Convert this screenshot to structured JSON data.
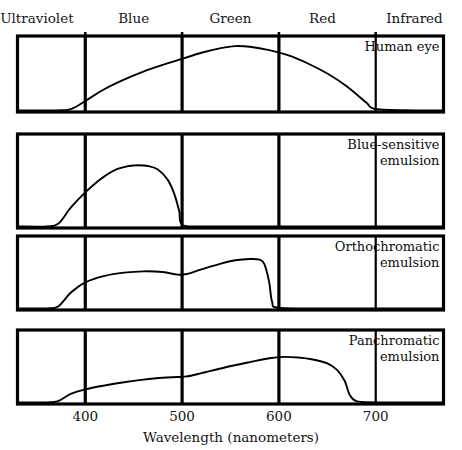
{
  "figure": {
    "title": "",
    "axis_title": "Wavelength (nanometers)",
    "band_headers": [
      {
        "label": "Ultraviolet",
        "center_nm": 350
      },
      {
        "label": "Blue",
        "center_nm": 450
      },
      {
        "label": "Green",
        "center_nm": 550
      },
      {
        "label": "Red",
        "center_nm": 645
      },
      {
        "label": "Infrared",
        "center_nm": 740
      }
    ],
    "tick_labels": [
      "400",
      "500",
      "600",
      "700"
    ],
    "panel_labels": [
      {
        "line1": "Human eye",
        "line2": ""
      },
      {
        "line1": "Blue-sensitive",
        "line2": "emulsion"
      },
      {
        "line1": "Orthochromatic",
        "line2": "emulsion"
      },
      {
        "line1": "Panchromatic",
        "line2": "emulsion"
      }
    ],
    "colors": {
      "ink": "#000000",
      "background": "#ffffff",
      "curve": "#000000",
      "frame": "#000000"
    }
  },
  "chart_data": {
    "type": "line",
    "xlabel": "Wavelength (nanometers)",
    "ylabel": "Relative sensitivity",
    "xlim": [
      330,
      770
    ],
    "ylim": [
      0,
      1
    ],
    "grid": false,
    "legend": "inside-panel-top-right",
    "xticks": [
      400,
      500,
      600,
      700
    ],
    "spectral_bands": [
      {
        "name": "Ultraviolet",
        "range_nm": [
          330,
          400
        ]
      },
      {
        "name": "Blue",
        "range_nm": [
          400,
          500
        ]
      },
      {
        "name": "Green",
        "range_nm": [
          500,
          600
        ]
      },
      {
        "name": "Red",
        "range_nm": [
          600,
          700
        ]
      },
      {
        "name": "Infrared",
        "range_nm": [
          700,
          770
        ]
      }
    ],
    "panels": [
      {
        "name": "Human eye",
        "x": [
          330,
          370,
          385,
          400,
          420,
          440,
          460,
          480,
          500,
          520,
          540,
          555,
          570,
          590,
          610,
          630,
          650,
          670,
          690,
          700,
          740,
          770
        ],
        "y": [
          0,
          0,
          0.02,
          0.14,
          0.32,
          0.46,
          0.58,
          0.68,
          0.77,
          0.86,
          0.93,
          0.96,
          0.95,
          0.9,
          0.82,
          0.7,
          0.55,
          0.36,
          0.12,
          0.02,
          0,
          0
        ]
      },
      {
        "name": "Blue-sensitive emulsion",
        "x": [
          330,
          360,
          372,
          385,
          400,
          415,
          430,
          445,
          455,
          465,
          475,
          485,
          492,
          497,
          500,
          520,
          560,
          600,
          700,
          770
        ],
        "y": [
          0,
          0,
          0.03,
          0.22,
          0.4,
          0.55,
          0.66,
          0.71,
          0.72,
          0.71,
          0.67,
          0.55,
          0.38,
          0.18,
          0.02,
          0,
          0,
          0,
          0,
          0
        ]
      },
      {
        "name": "Orthochromatic emulsion",
        "x": [
          330,
          360,
          372,
          385,
          400,
          420,
          440,
          460,
          480,
          495,
          505,
          520,
          540,
          555,
          570,
          580,
          585,
          590,
          593,
          600,
          650,
          700,
          770
        ],
        "y": [
          0,
          0,
          0.03,
          0.24,
          0.4,
          0.5,
          0.55,
          0.57,
          0.56,
          0.52,
          0.53,
          0.6,
          0.69,
          0.74,
          0.76,
          0.75,
          0.68,
          0.4,
          0.1,
          0.01,
          0,
          0,
          0
        ]
      },
      {
        "name": "Panchromatic emulsion",
        "x": [
          330,
          360,
          372,
          385,
          400,
          420,
          440,
          460,
          480,
          495,
          505,
          520,
          545,
          570,
          590,
          605,
          620,
          635,
          650,
          660,
          668,
          673,
          680,
          700,
          770
        ],
        "y": [
          0,
          0,
          0.02,
          0.13,
          0.2,
          0.26,
          0.31,
          0.35,
          0.38,
          0.39,
          0.4,
          0.45,
          0.54,
          0.62,
          0.68,
          0.7,
          0.69,
          0.66,
          0.6,
          0.5,
          0.33,
          0.12,
          0.02,
          0,
          0
        ]
      }
    ]
  }
}
